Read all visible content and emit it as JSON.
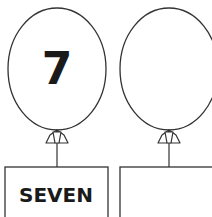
{
  "worksheet": {
    "balloons": [
      {
        "number": "7",
        "word": "SEVEN"
      },
      {
        "number": "",
        "word": ""
      }
    ]
  },
  "colors": {
    "ink": "#1a1a1a",
    "paper": "#ffffff"
  }
}
